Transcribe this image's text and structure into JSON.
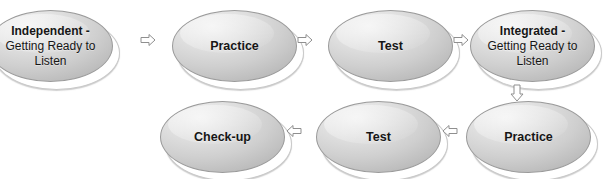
{
  "diagram": {
    "colors": {
      "node_fill_light": "#f1f1f1",
      "node_fill_dark": "#9e9e9e",
      "node_border": "#9a9a9a",
      "text": "#161616",
      "arrow_fill": "#ffffff",
      "arrow_stroke": "#8f8f8f",
      "background": "#ffffff"
    },
    "rows": [
      {
        "name": "top-row",
        "nodes": [
          {
            "id": "independent-getting-ready-to-listen",
            "line1": "Independent -",
            "line2": "Getting Ready to Listen",
            "two_line": true
          },
          {
            "id": "practice-top",
            "line1": "Practice",
            "line2": "",
            "two_line": false
          },
          {
            "id": "test-top",
            "line1": "Test",
            "line2": "",
            "two_line": false
          },
          {
            "id": "integrated-getting-ready-to-listen",
            "line1": "Integrated -",
            "line2": "Getting Ready to Listen",
            "two_line": true
          }
        ]
      },
      {
        "name": "bottom-row",
        "nodes": [
          {
            "id": "check-up",
            "line1": "Check-up",
            "line2": "",
            "two_line": false
          },
          {
            "id": "test-bottom",
            "line1": "Test",
            "line2": "",
            "two_line": false
          },
          {
            "id": "practice-bottom",
            "line1": "Practice",
            "line2": "",
            "two_line": false
          }
        ]
      }
    ],
    "arrows": [
      {
        "id": "arrow-independent-to-practice",
        "direction": "right"
      },
      {
        "id": "arrow-practice-to-test",
        "direction": "right"
      },
      {
        "id": "arrow-test-to-integrated",
        "direction": "right"
      },
      {
        "id": "arrow-integrated-to-practice-down",
        "direction": "down"
      },
      {
        "id": "arrow-practice-to-test-bottom",
        "direction": "left"
      },
      {
        "id": "arrow-test-to-checkup-bottom",
        "direction": "left"
      }
    ]
  }
}
